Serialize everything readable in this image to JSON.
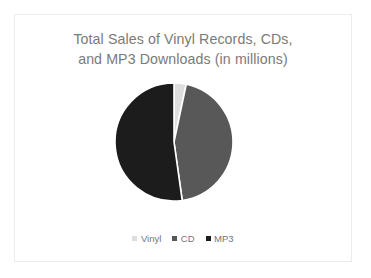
{
  "slide": {
    "background_color": "#ffffff",
    "border_color": "#ececec"
  },
  "title": {
    "line1": "Total Sales of Vinyl Records, CDs,",
    "line2": "and MP3 Downloads (in millions)",
    "color": "#7a7a7a"
  },
  "legend": {
    "position": "bottom",
    "items": [
      {
        "label": "Vinyl",
        "color": "#dedede"
      },
      {
        "label": "CD",
        "color": "#585858"
      },
      {
        "label": "MP3",
        "color": "#1c1c1c"
      }
    ]
  },
  "chart_data": {
    "type": "pie",
    "title": "Total Sales of Vinyl Records, CDs, and MP3 Downloads (in millions)",
    "xlabel": "",
    "ylabel": "",
    "categories": [
      "Vinyl",
      "CD",
      "MP3"
    ],
    "values": [
      3.3,
      44.4,
      52.3
    ],
    "units": "percent of total",
    "colors": [
      "#dedede",
      "#585858",
      "#1c1c1c"
    ],
    "slice_angles_deg": [
      12,
      160,
      188
    ],
    "start_angle_deg": 0,
    "direction": "clockwise",
    "slice_separator_color": "#ffffff",
    "grid": false,
    "legend_position": "bottom"
  },
  "geometry": {
    "center_x": 62,
    "center_y": 62,
    "radius": 59
  }
}
